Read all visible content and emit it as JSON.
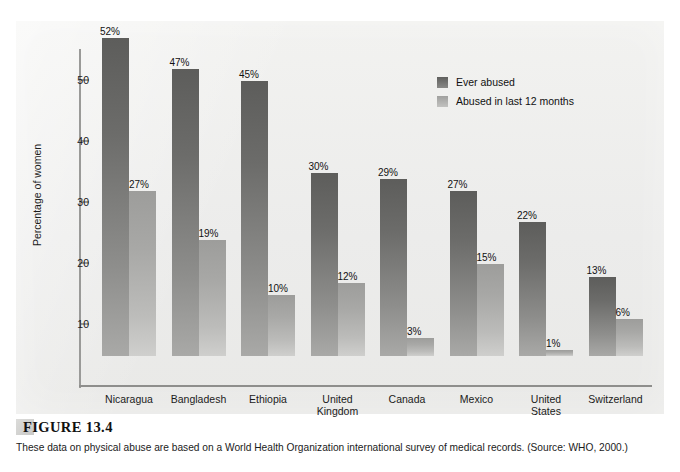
{
  "page": {
    "running_head": "",
    "folio": ""
  },
  "figure": {
    "number_label": "FIGURE 13.4",
    "caption": "These data on physical abuse are based on a World Health Organization international survey of medical records. (Source: WHO, 2000.)"
  },
  "legend": {
    "items": [
      {
        "label": "Ever abused",
        "color": "#6c6c6a",
        "key": "ever"
      },
      {
        "label": "Abused in last 12 months",
        "color": "#b0b0ae",
        "key": "recent"
      }
    ]
  },
  "axes": {
    "y_title": "Percentage of women",
    "y_ticks": [
      "10",
      "20",
      "30",
      "40",
      "50"
    ]
  },
  "chart_data": {
    "type": "bar",
    "title": "",
    "subtitle": "",
    "xlabel": "",
    "ylabel": "Percentage of women",
    "ylim": [
      0,
      55
    ],
    "yticks": [
      10,
      20,
      30,
      40,
      50
    ],
    "grid": false,
    "legend_position": "top-right-inside",
    "categories": [
      "Nicaragua",
      "Bangladesh",
      "Ethiopia",
      "United Kingdom",
      "Canada",
      "Mexico",
      "United States",
      "Switzerland"
    ],
    "category_lines": [
      [
        "Nicaragua"
      ],
      [
        "Bangladesh"
      ],
      [
        "Ethiopia"
      ],
      [
        "United",
        "Kingdom"
      ],
      [
        "Canada"
      ],
      [
        "Mexico"
      ],
      [
        "United",
        "States"
      ],
      [
        "Switzerland"
      ]
    ],
    "series": [
      {
        "name": "Ever abused",
        "color": "#6c6c6a",
        "values": [
          52,
          47,
          45,
          30,
          29,
          27,
          22,
          13
        ],
        "labels": [
          "52%",
          "47%",
          "45%",
          "30%",
          "29%",
          "27%",
          "22%",
          "13%"
        ]
      },
      {
        "name": "Abused in last 12 months",
        "color": "#b0b0ae",
        "values": [
          27,
          19,
          10,
          12,
          3,
          15,
          1,
          6
        ],
        "labels": [
          "27%",
          "19%",
          "10%",
          "12%",
          "3%",
          "15%",
          "1%",
          "6%"
        ]
      }
    ],
    "annotations": []
  }
}
